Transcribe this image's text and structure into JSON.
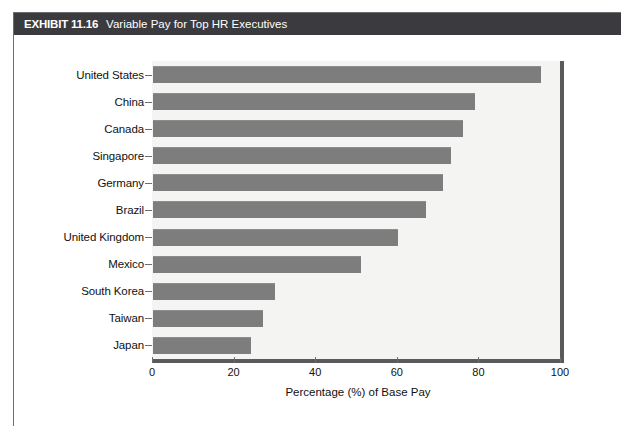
{
  "exhibit": {
    "number": "EXHIBIT 11.16",
    "title": "Variable Pay for Top HR Executives"
  },
  "chart_data": {
    "type": "bar",
    "orientation": "horizontal",
    "title": "Variable Pay for Top HR Executives",
    "xlabel": "Percentage (%) of Base Pay",
    "ylabel": "",
    "xlim": [
      0,
      100
    ],
    "xticks": [
      0,
      20,
      40,
      60,
      80,
      100
    ],
    "xtick_labels": [
      "0",
      "20",
      "40",
      "60",
      "80",
      "100"
    ],
    "grid": false,
    "legend": false,
    "bar_color": "#7d7d7d",
    "plot_background": "#f4f4f2",
    "categories": [
      "United States",
      "China",
      "Canada",
      "Singapore",
      "Germany",
      "Brazil",
      "United Kingdom",
      "Mexico",
      "South Korea",
      "Taiwan",
      "Japan"
    ],
    "values": [
      95,
      79,
      76,
      73,
      71,
      67,
      60,
      51,
      30,
      27,
      24
    ]
  },
  "colors": {
    "banner": "#3b3b3f",
    "frame_border": "#6e6e70",
    "axis": "#5a5a5c",
    "bar": "#7d7d7d",
    "plot_bg": "#f4f4f2",
    "page_bg": "#ffffff"
  }
}
